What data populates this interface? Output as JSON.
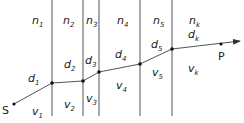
{
  "diagram": {
    "type": "ray path through layered media",
    "source_label": "S",
    "target_label": "P",
    "layers": [
      {
        "n": "n",
        "n_sub": "1",
        "d": "d",
        "d_sub": "1",
        "v": "v",
        "v_sub": "1"
      },
      {
        "n": "n",
        "n_sub": "2",
        "d": "d",
        "d_sub": "2",
        "v": "v",
        "v_sub": "2"
      },
      {
        "n": "n",
        "n_sub": "3",
        "d": "d",
        "d_sub": "3",
        "v": "v",
        "v_sub": "3"
      },
      {
        "n": "n",
        "n_sub": "4",
        "d": "d",
        "d_sub": "4",
        "v": "v",
        "v_sub": "4"
      },
      {
        "n": "n",
        "n_sub": "5",
        "d": "d",
        "d_sub": "5",
        "v": "v",
        "v_sub": "5"
      },
      {
        "n": "n",
        "n_sub": "k",
        "d": "d",
        "d_sub": "k",
        "v": "v",
        "v_sub": "k"
      }
    ],
    "line_color": "#555555",
    "point_color": "#111111"
  }
}
